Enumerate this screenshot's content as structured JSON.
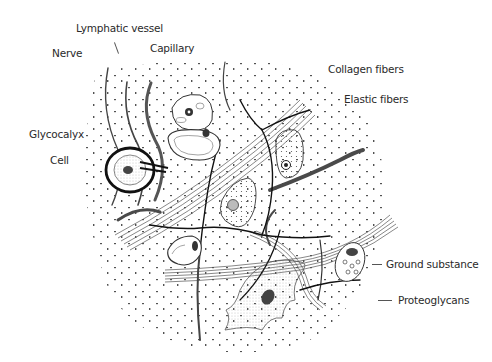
{
  "diagram": {
    "style": "black-and-white pen-and-ink drawing",
    "labels": {
      "lymphatic_vessel": "Lymphatic vessel",
      "nerve": "Nerve",
      "capillary": "Capillary",
      "collagen_fibers": "Collagen fibers",
      "elastic_fibers": "Elastic fibers",
      "glycocalyx": "Glycocalyx",
      "cell": "Cell",
      "ground_substance": "Ground substance",
      "proteoglycans": "Proteoglycans"
    },
    "colors": {
      "ink": "#1a1a1a",
      "label_text": "#2a2a2a",
      "background": "#ffffff",
      "fiber_gray": "#6a6a6a"
    }
  }
}
